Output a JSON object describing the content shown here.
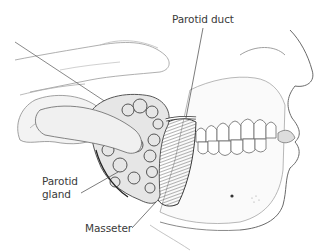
{
  "figure": {
    "style": "pencil illustration, grayscale",
    "labels": {
      "parotid_duct": "Parotid duct",
      "parotid_gland_line1": "Parotid",
      "parotid_gland_line2": "gland",
      "masseter": "Masseter"
    }
  },
  "colors": {
    "background": "#ffffff",
    "ink": "#3a3a3a",
    "sketch": "#8a8a8a",
    "shade": "#5a5a5a"
  }
}
